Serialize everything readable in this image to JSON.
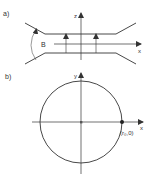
{
  "figure_a": {
    "label": "a)",
    "z_axis_label": "z",
    "x_axis_label": "x",
    "angle_label": "B"
  },
  "figure_b": {
    "label": "b)",
    "y_axis_label": "y",
    "x_axis_label": "x",
    "point_label": "(r₀,0)"
  },
  "colors": {
    "stroke": "#333333",
    "background": "#ffffff"
  }
}
